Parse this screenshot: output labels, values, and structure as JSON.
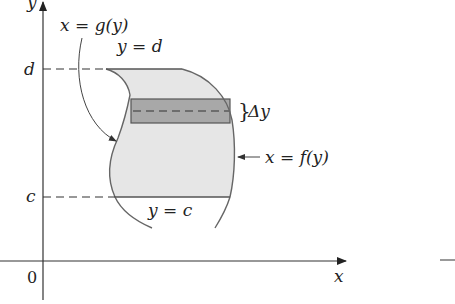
{
  "figure": {
    "type": "region-between-curves-in-y",
    "axes": {
      "x_label": "x",
      "y_label": "y",
      "origin_label": "0"
    },
    "ticks": {
      "d_label": "d",
      "c_label": "c"
    },
    "curves": {
      "left_label": "x = g(y)",
      "right_label": "x = f(y)"
    },
    "bounds": {
      "top_label": "y = d",
      "bottom_label": "y = c"
    },
    "strip": {
      "label": "Δy",
      "brace": "}"
    },
    "colors": {
      "region_fill": "#e6e6e6",
      "strip_fill": "#a8a8a8",
      "curve_stroke": "#666666",
      "axis_stroke": "#333333"
    }
  }
}
